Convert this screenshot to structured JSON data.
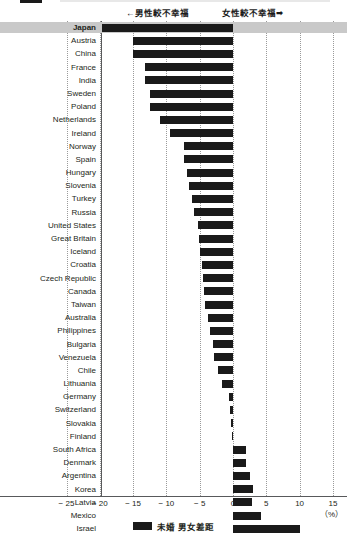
{
  "header": {
    "left_annotation": "←男性較不幸福",
    "right_annotation": "女性較不幸福➡"
  },
  "legend": {
    "label": "未婚 男女差距",
    "swatch_color": "#1a1a1a"
  },
  "axis": {
    "unit_label": "（%）",
    "ticks": [
      "− 25",
      "− 20",
      "− 15",
      "− 10",
      "− 5",
      "0",
      "5",
      "10",
      "15"
    ]
  },
  "highlight_row": "Japan",
  "highlight_color": "#c9c9c9",
  "chart_data": {
    "type": "bar",
    "orientation": "horizontal",
    "title": "",
    "xlabel": "（%）",
    "ylabel": "",
    "xlim": [
      -25,
      15
    ],
    "xticks": [
      -25,
      -20,
      -15,
      -10,
      -5,
      0,
      5,
      10,
      15
    ],
    "grid": true,
    "legend_position": "bottom-center",
    "series_name": "未婚 男女差距",
    "annotations": [
      "←男性較不幸福",
      "女性較不幸福➡"
    ],
    "categories": [
      "Japan",
      "Austria",
      "China",
      "France",
      "India",
      "Sweden",
      "Poland",
      "Netherlands",
      "Ireland",
      "Norway",
      "Spain",
      "Hungary",
      "Slovenia",
      "Turkey",
      "Russia",
      "United States",
      "Great Britain",
      "Iceland",
      "Croatia",
      "Czech Republic",
      "Canada",
      "Taiwan",
      "Australia",
      "Philippines",
      "Bulgaria",
      "Venezuela",
      "Chile",
      "Lithuania",
      "Germany",
      "Switzerland",
      "Slovakia",
      "Finland",
      "South Africa",
      "Denmark",
      "Argentina",
      "Korea",
      "Latvia",
      "Mexico",
      "Israel"
    ],
    "values": [
      -19.6,
      -15.0,
      -15.0,
      -13.2,
      -13.2,
      -12.4,
      -12.4,
      -11.0,
      -9.4,
      -7.4,
      -7.4,
      -6.9,
      -6.6,
      -6.2,
      -5.9,
      -5.3,
      -5.1,
      -4.9,
      -4.7,
      -4.5,
      -4.4,
      -4.2,
      -3.8,
      -3.4,
      -3.0,
      -2.8,
      -2.2,
      -1.6,
      -0.6,
      -0.4,
      -0.3,
      -0.2,
      1.9,
      2.0,
      2.6,
      3.0,
      2.9,
      4.2,
      10.0
    ]
  }
}
